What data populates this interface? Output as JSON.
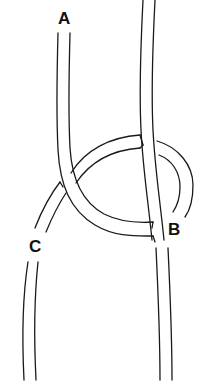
{
  "diagram": {
    "type": "knot illustration",
    "labels": [
      {
        "id": "A",
        "text": "A",
        "x": 58,
        "y": 10
      },
      {
        "id": "B",
        "text": "B",
        "x": 168,
        "y": 221
      },
      {
        "id": "C",
        "text": "C",
        "x": 29,
        "y": 238
      }
    ],
    "colors": {
      "line": "#1a1a1a",
      "background": "#ffffff"
    }
  }
}
